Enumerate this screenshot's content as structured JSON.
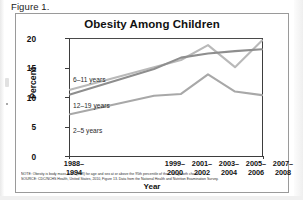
{
  "figure": {
    "caption": "Figure 1."
  },
  "chart_data": {
    "type": "line",
    "title": "Obesity Among Children",
    "xlabel": "Year",
    "ylabel": "Percent",
    "ylim": [
      0,
      20
    ],
    "yticks": [
      "0",
      "5",
      "10",
      "15",
      "20"
    ],
    "grid": false,
    "legend": "inline-labels",
    "categories": [
      "1988–1994",
      "1999–2000",
      "2001–2002",
      "2003–2004",
      "2005–2006",
      "2007–2008"
    ],
    "category_lines": [
      [
        "1988–",
        "1994"
      ],
      [
        "1999–",
        "2000"
      ],
      [
        "2001–",
        "2002"
      ],
      [
        "2003–",
        "2004"
      ],
      [
        "2005–",
        "2006"
      ],
      [
        "2007–",
        "2008"
      ]
    ],
    "series": [
      {
        "name": "6–11 years",
        "values": [
          11.3,
          15.1,
          16.3,
          18.8,
          15.1,
          19.6
        ],
        "color": "#b9b9b9"
      },
      {
        "name": "12–19 years",
        "values": [
          10.5,
          14.8,
          16.7,
          17.4,
          17.8,
          18.1
        ],
        "color": "#8e8e8e"
      },
      {
        "name": "2–5 years",
        "values": [
          7.2,
          10.3,
          10.6,
          13.9,
          11.0,
          10.4
        ],
        "color": "#a8a8a8"
      }
    ],
    "note": "NOTE: Obesity is body mass index (BMI) for age and sex at or above the 95th percentile of the CDC growth charts.",
    "source": "SOURCE: CDC/NCHS Health, United States, 2010, Figure 13. Data from the National Health and Nutrition Examination Survey."
  }
}
